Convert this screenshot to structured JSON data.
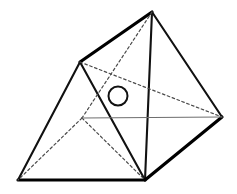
{
  "figure": {
    "canvas": {
      "width": 237,
      "height": 194,
      "background": "#ffffff"
    },
    "style": {
      "solid_color": "#111111",
      "heavy_color": "#000000",
      "hidden_color": "#4a4a4a",
      "faint_color": "#6e6e6e",
      "marker_fill": "#ffffff",
      "solid_width": 2.1,
      "heavy_width": 3.2,
      "hidden_width": 1.2,
      "faint_width": 1.1,
      "hidden_dash": "2.6 2.6",
      "faint_dash": "none"
    },
    "vertices": [
      {
        "id": "apex",
        "label": "top apex",
        "x": 152,
        "y": 12
      },
      {
        "id": "upper_left",
        "label": "upper left vertex",
        "x": 80,
        "y": 62
      },
      {
        "id": "bottom_left",
        "label": "bottom left vertex",
        "x": 18,
        "y": 180
      },
      {
        "id": "bottom",
        "label": "bottom vertex",
        "x": 145,
        "y": 180
      },
      {
        "id": "right",
        "label": "right vertex",
        "x": 222,
        "y": 117
      },
      {
        "id": "interior",
        "label": "hidden interior vertex",
        "x": 82,
        "y": 118
      }
    ],
    "edges": [
      {
        "id": "e-apex-upperleft",
        "from": "apex",
        "to": "upper_left",
        "kind": "heavy"
      },
      {
        "id": "e-apex-right",
        "from": "apex",
        "to": "right",
        "kind": "solid"
      },
      {
        "id": "e-apex-bottom",
        "from": "apex",
        "to": "bottom",
        "kind": "solid"
      },
      {
        "id": "e-upperleft-bottomleft",
        "from": "upper_left",
        "to": "bottom_left",
        "kind": "solid"
      },
      {
        "id": "e-upperleft-bottom",
        "from": "upper_left",
        "to": "bottom",
        "kind": "solid"
      },
      {
        "id": "e-bottomleft-bottom",
        "from": "bottom_left",
        "to": "bottom",
        "kind": "heavy"
      },
      {
        "id": "e-bottom-right",
        "from": "bottom",
        "to": "right",
        "kind": "heavy"
      },
      {
        "id": "e-apex-interior",
        "from": "apex",
        "to": "interior",
        "kind": "hidden"
      },
      {
        "id": "e-upperleft-right",
        "from": "upper_left",
        "to": "right",
        "kind": "hidden"
      },
      {
        "id": "e-interior-bottomleft",
        "from": "interior",
        "to": "bottom_left",
        "kind": "hidden"
      },
      {
        "id": "e-interior-bottom",
        "from": "interior",
        "to": "bottom",
        "kind": "hidden"
      },
      {
        "id": "e-interior-right",
        "from": "interior",
        "to": "right",
        "kind": "faint"
      }
    ],
    "markers": [
      {
        "id": "center-circle",
        "label": "marked point",
        "cx": 118,
        "cy": 96,
        "r": 9.5,
        "stroke_width": 2.0
      }
    ]
  }
}
